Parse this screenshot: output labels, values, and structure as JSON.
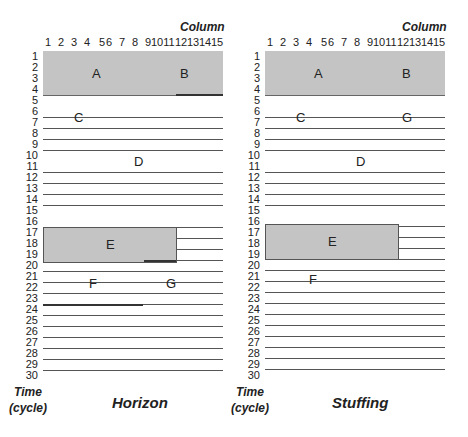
{
  "axis": {
    "column_title": "Column",
    "columns": [
      "1",
      "2",
      "3",
      "4",
      "5",
      "6",
      "7",
      "8",
      "9",
      "10",
      "11",
      "12",
      "13",
      "14",
      "15"
    ],
    "rows": [
      "1",
      "2",
      "3",
      "4",
      "5",
      "6",
      "7",
      "8",
      "9",
      "10",
      "11",
      "12",
      "13",
      "14",
      "15",
      "16",
      "17",
      "18",
      "19",
      "20",
      "21",
      "22",
      "23",
      "24",
      "25",
      "26",
      "27",
      "28",
      "29",
      "30"
    ],
    "time_label_line1": "Time",
    "time_label_line2": "(cycle)"
  },
  "panels": [
    {
      "title": "Horizon",
      "blocks": [
        {
          "label": "A",
          "rows": [
            1,
            4
          ],
          "cols": [
            1,
            15
          ],
          "shaded": true
        },
        {
          "label": "B",
          "rows": [
            1,
            4
          ],
          "cols": [
            1,
            15
          ],
          "shaded": true
        },
        {
          "label": "C",
          "row": 6,
          "col": 3
        },
        {
          "label": "D",
          "row": 10,
          "col": 8
        },
        {
          "label": "E",
          "rows": [
            16,
            19
          ],
          "cols": [
            1,
            11
          ],
          "shaded": true
        },
        {
          "label": "F",
          "row": 21,
          "col": 4
        },
        {
          "label": "G",
          "row": 21,
          "col": 12
        }
      ]
    },
    {
      "title": "Stuffing",
      "blocks": [
        {
          "label": "A",
          "rows": [
            1,
            4
          ],
          "cols": [
            1,
            15
          ],
          "shaded": true
        },
        {
          "label": "B",
          "rows": [
            1,
            4
          ],
          "cols": [
            1,
            15
          ],
          "shaded": true
        },
        {
          "label": "C",
          "row": 6,
          "col": 3
        },
        {
          "label": "G",
          "row": 6,
          "col": 12
        },
        {
          "label": "D",
          "row": 10,
          "col": 8
        },
        {
          "label": "E",
          "rows": [
            16,
            19
          ],
          "cols": [
            1,
            11
          ],
          "shaded": true
        },
        {
          "label": "F",
          "row": 21,
          "col": 4
        }
      ]
    }
  ],
  "colors": {
    "block_fill": "#c4c4c4",
    "line": "#555555"
  }
}
